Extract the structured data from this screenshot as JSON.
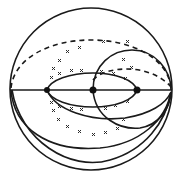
{
  "figure": {
    "colors": {
      "line": "#1a1a1a",
      "background": "#ffffff"
    },
    "outer_circle": {
      "cx": 91,
      "cy": 89,
      "r": 81
    },
    "diameter_y": 90,
    "points": [
      {
        "name": "left-point",
        "x": 47,
        "y": 90
      },
      {
        "name": "center-point",
        "x": 93,
        "y": 90
      },
      {
        "name": "right-point",
        "x": 137,
        "y": 90
      }
    ]
  }
}
